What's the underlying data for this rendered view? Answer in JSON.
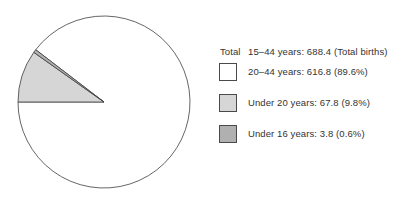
{
  "chart_data": {
    "type": "pie",
    "title": "",
    "legend_position": "right",
    "slices": [
      {
        "id": "20to44",
        "label": "20–44 years",
        "value": 616.8,
        "percent": 89.6,
        "color": "#ffffff",
        "legend_text": "20–44 years: 616.8 (89.6%)"
      },
      {
        "id": "under20",
        "label": "Under 20 years",
        "value": 67.8,
        "percent": 9.8,
        "color": "#d6d6d6",
        "legend_text": "Under 20 years: 67.8 (9.8%)"
      },
      {
        "id": "under16",
        "label": "Under 16 years",
        "value": 3.8,
        "percent": 0.6,
        "color": "#b0b0b0",
        "legend_text": "Under 16 years: 3.8 (0.6%)"
      }
    ],
    "pie": {
      "cx": 104,
      "cy": 102,
      "r": 86,
      "start_angle_deg": 180,
      "screen_clockwise": true,
      "draw_order": [
        1,
        2,
        0
      ],
      "outline_color": "#3f3f3f"
    }
  },
  "legend": {
    "total_label": "Total",
    "total_text": "15–44 years: 688.4 (Total births)"
  }
}
